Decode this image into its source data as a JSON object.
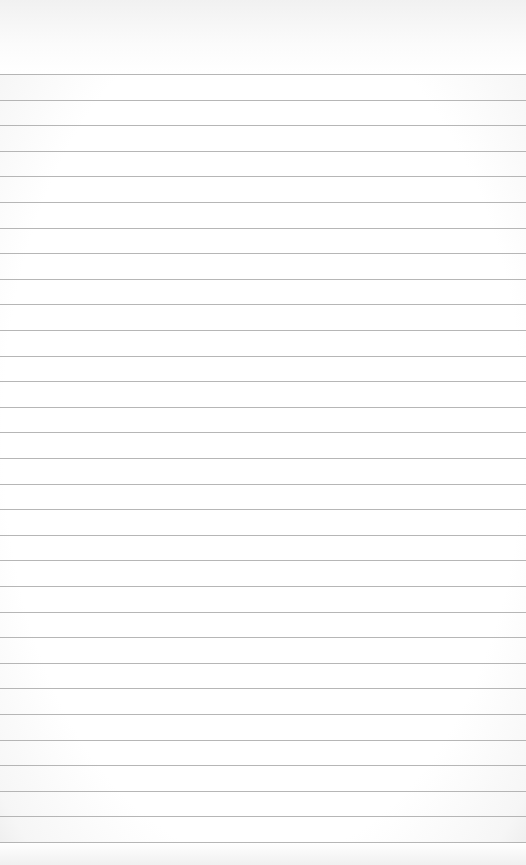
{
  "page": {
    "type": "ruled-notepad-sheet",
    "background_color": "#ffffff",
    "line_color": "#a9a9a9",
    "first_line_y": 74,
    "line_spacing": 25.6,
    "line_count": 31,
    "text_content": []
  }
}
